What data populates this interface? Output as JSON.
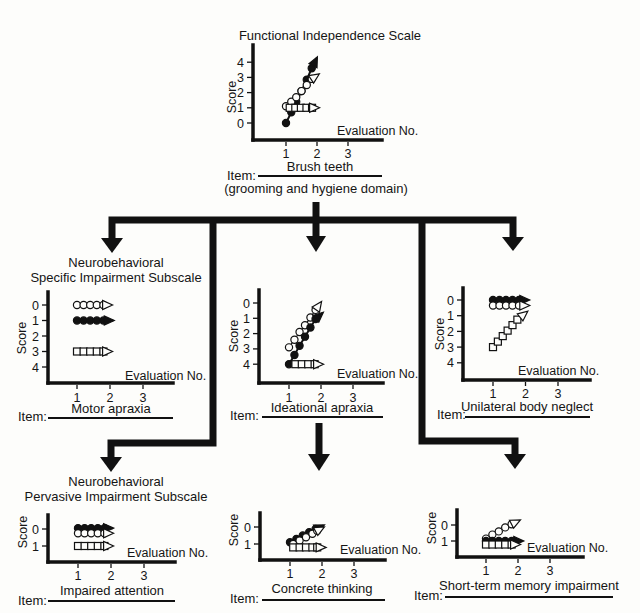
{
  "subscales": [
    {
      "line1": "Neurobehavioral",
      "line2": "Specific Impairment Subscale"
    },
    {
      "line1": "Neurobehavioral",
      "line2": "Pervasive Impairment Subscale"
    }
  ],
  "item_prefix": "Item:",
  "chart_data": [
    {
      "type": "line",
      "title": "Functional Independence Scale",
      "xlabel": "Evaluation No.",
      "ylabel": "Score",
      "x_ticks": [
        1,
        2,
        3
      ],
      "y_ticks": [
        0,
        1,
        2,
        3,
        4
      ],
      "y_order": "0-bottom",
      "item": "Brush teeth",
      "item_note": "(grooming and hygiene domain)",
      "series": [
        {
          "name": "filled circles",
          "marker": "filled-circle",
          "points": [
            [
              1,
              0
            ],
            [
              1.17,
              0.7
            ],
            [
              1.33,
              1.4
            ],
            [
              1.5,
              2.1
            ],
            [
              1.67,
              2.85
            ],
            [
              1.83,
              3.6
            ]
          ],
          "arrow_to": [
            2.0,
            4.3
          ]
        },
        {
          "name": "open circles",
          "marker": "open-circle",
          "points": [
            [
              1,
              1.1
            ],
            [
              1.17,
              1.4
            ],
            [
              1.33,
              1.7
            ],
            [
              1.5,
              2.1
            ],
            [
              1.67,
              2.5
            ],
            [
              1.83,
              2.9
            ]
          ],
          "arrow_to": [
            2.05,
            3.2
          ]
        },
        {
          "name": "open squares",
          "marker": "open-square",
          "points": [
            [
              1.12,
              1
            ],
            [
              1.3,
              1
            ],
            [
              1.48,
              1
            ],
            [
              1.66,
              1
            ],
            [
              1.84,
              1
            ]
          ],
          "arrow_to": [
            2.05,
            1
          ]
        }
      ]
    },
    {
      "type": "line",
      "xlabel": "Evaluation No.",
      "ylabel": "Score",
      "x_ticks": [
        1,
        2,
        3
      ],
      "y_ticks": [
        0,
        1,
        2,
        3,
        4
      ],
      "y_order": "0-top",
      "item": "Motor apraxia",
      "series": [
        {
          "name": "open circles",
          "marker": "open-circle",
          "points": [
            [
              1,
              0
            ],
            [
              1.2,
              0
            ],
            [
              1.4,
              0
            ],
            [
              1.6,
              0
            ],
            [
              1.8,
              0
            ]
          ],
          "arrow_to": [
            2.05,
            0
          ]
        },
        {
          "name": "filled circles",
          "marker": "filled-circle",
          "points": [
            [
              1,
              1
            ],
            [
              1.2,
              1
            ],
            [
              1.4,
              1
            ],
            [
              1.6,
              1
            ],
            [
              1.8,
              1
            ]
          ],
          "arrow_to": [
            2.1,
            1
          ]
        },
        {
          "name": "open squares",
          "marker": "open-square",
          "points": [
            [
              1,
              3
            ],
            [
              1.2,
              3
            ],
            [
              1.4,
              3
            ],
            [
              1.6,
              3
            ],
            [
              1.8,
              3
            ]
          ],
          "arrow_to": [
            2.05,
            3
          ]
        }
      ]
    },
    {
      "type": "line",
      "xlabel": "Evaluation No.",
      "ylabel": "Score",
      "x_ticks": [
        1,
        2,
        3
      ],
      "y_ticks": [
        0,
        1,
        2,
        3,
        4
      ],
      "y_order": "0-top",
      "item": "Ideational apraxia",
      "series": [
        {
          "name": "open circles",
          "marker": "open-circle",
          "points": [
            [
              1,
              2.9
            ],
            [
              1.17,
              2.4
            ],
            [
              1.33,
              1.9
            ],
            [
              1.5,
              1.45
            ],
            [
              1.67,
              0.95
            ],
            [
              1.83,
              0.45
            ]
          ],
          "arrow_to": [
            2.0,
            -0.05
          ]
        },
        {
          "name": "filled circles",
          "marker": "filled-circle",
          "points": [
            [
              1,
              4
            ],
            [
              1.17,
              3.4
            ],
            [
              1.33,
              2.8
            ],
            [
              1.5,
              2.2
            ],
            [
              1.67,
              1.6
            ],
            [
              1.83,
              1.05
            ]
          ],
          "arrow_to": [
            2.05,
            0.65
          ]
        },
        {
          "name": "open squares",
          "marker": "open-square",
          "points": [
            [
              1.2,
              4
            ],
            [
              1.4,
              4
            ],
            [
              1.6,
              4
            ],
            [
              1.8,
              4
            ]
          ],
          "arrow_to": [
            2.05,
            4
          ]
        }
      ]
    },
    {
      "type": "line",
      "xlabel": "Evaluation No.",
      "ylabel": "Score",
      "x_ticks": [
        1,
        2,
        3
      ],
      "y_ticks": [
        0,
        1,
        2,
        3,
        4
      ],
      "y_order": "0-top",
      "item": "Unilateral body neglect",
      "series": [
        {
          "name": "filled circles",
          "marker": "filled-circle",
          "points": [
            [
              1,
              0
            ],
            [
              1.2,
              0
            ],
            [
              1.4,
              0
            ],
            [
              1.6,
              0
            ],
            [
              1.8,
              0
            ]
          ],
          "arrow_to": [
            2.1,
            0
          ]
        },
        {
          "name": "open circles",
          "marker": "open-circle",
          "points": [
            [
              1,
              0.35
            ],
            [
              1.2,
              0.35
            ],
            [
              1.4,
              0.35
            ],
            [
              1.6,
              0.35
            ],
            [
              1.8,
              0.35
            ]
          ],
          "arrow_to": [
            2.1,
            0.35
          ]
        },
        {
          "name": "open squares",
          "marker": "open-square",
          "points": [
            [
              1,
              3
            ],
            [
              1.15,
              2.65
            ],
            [
              1.3,
              2.3
            ],
            [
              1.45,
              1.95
            ],
            [
              1.6,
              1.6
            ],
            [
              1.75,
              1.25
            ]
          ],
          "arrow_to": [
            2.05,
            0.75
          ]
        }
      ]
    },
    {
      "type": "line",
      "xlabel": "Evaluation No.",
      "ylabel": "Score",
      "x_ticks": [
        1,
        2,
        3
      ],
      "y_ticks": [
        0,
        1
      ],
      "y_order": "0-top",
      "item": "Impaired attention",
      "series": [
        {
          "name": "filled circles",
          "marker": "filled-circle",
          "points": [
            [
              1,
              -0.05
            ],
            [
              1.2,
              -0.05
            ],
            [
              1.4,
              -0.05
            ],
            [
              1.6,
              -0.05
            ],
            [
              1.8,
              -0.05
            ]
          ],
          "arrow_to": [
            2.05,
            -0.05
          ]
        },
        {
          "name": "open circles",
          "marker": "open-circle",
          "points": [
            [
              1,
              0.25
            ],
            [
              1.2,
              0.25
            ],
            [
              1.4,
              0.25
            ],
            [
              1.6,
              0.25
            ],
            [
              1.8,
              0.25
            ]
          ],
          "arrow_to": [
            2.05,
            0.25
          ]
        },
        {
          "name": "open squares",
          "marker": "open-square",
          "points": [
            [
              1,
              1
            ],
            [
              1.2,
              1
            ],
            [
              1.4,
              1
            ],
            [
              1.6,
              1
            ],
            [
              1.8,
              1
            ]
          ],
          "arrow_to": [
            2.05,
            1
          ]
        }
      ]
    },
    {
      "type": "line",
      "xlabel": "Evaluation No.",
      "ylabel": "Score",
      "x_ticks": [
        1,
        2,
        3
      ],
      "y_ticks": [
        0,
        1
      ],
      "y_order": "0-top",
      "item": "Concrete thinking",
      "series": [
        {
          "name": "filled circles",
          "marker": "filled-circle",
          "points": [
            [
              1,
              0.9
            ],
            [
              1.2,
              0.7
            ],
            [
              1.4,
              0.5
            ],
            [
              1.6,
              0.3
            ],
            [
              1.8,
              0.12
            ]
          ],
          "arrow_to": [
            2.05,
            -0.1
          ]
        },
        {
          "name": "open circles",
          "marker": "open-circle",
          "points": [
            [
              1.1,
              1
            ],
            [
              1.3,
              0.8
            ],
            [
              1.5,
              0.6
            ],
            [
              1.7,
              0.4
            ],
            [
              1.85,
              0.22
            ]
          ],
          "arrow_to": [
            2.05,
            0.02
          ]
        },
        {
          "name": "open squares",
          "marker": "open-square",
          "points": [
            [
              1.1,
              1.2
            ],
            [
              1.3,
              1.2
            ],
            [
              1.5,
              1.2
            ],
            [
              1.7,
              1.2
            ],
            [
              1.85,
              1.2
            ]
          ],
          "arrow_to": [
            2.1,
            1.2
          ]
        }
      ]
    },
    {
      "type": "line",
      "xlabel": "Evaluation No.",
      "ylabel": "Score",
      "x_ticks": [
        1,
        2,
        3
      ],
      "y_ticks": [
        0,
        1
      ],
      "y_order": "0-top",
      "item": "Short-term memory impairment",
      "series": [
        {
          "name": "open circles",
          "marker": "open-circle",
          "points": [
            [
              1,
              0.85
            ],
            [
              1.2,
              0.6
            ],
            [
              1.4,
              0.4
            ],
            [
              1.6,
              0.15
            ],
            [
              1.8,
              -0.05
            ]
          ],
          "arrow_to": [
            2.05,
            -0.3
          ]
        },
        {
          "name": "filled circles",
          "marker": "filled-circle",
          "points": [
            [
              1,
              1
            ],
            [
              1.2,
              1
            ],
            [
              1.4,
              1
            ],
            [
              1.6,
              1
            ],
            [
              1.8,
              1
            ]
          ],
          "arrow_to": [
            2.15,
            1
          ]
        },
        {
          "name": "open squares",
          "marker": "open-square",
          "points": [
            [
              1,
              1.22
            ],
            [
              1.2,
              1.22
            ],
            [
              1.4,
              1.22
            ],
            [
              1.6,
              1.22
            ],
            [
              1.8,
              1.22
            ]
          ],
          "arrow_to": [
            2.05,
            1.22
          ]
        }
      ]
    }
  ]
}
